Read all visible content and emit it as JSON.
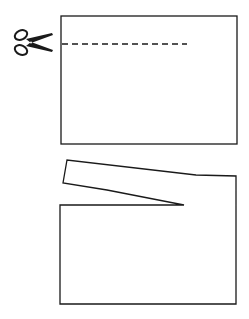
{
  "diagram": {
    "colors": {
      "stroke": "#1a1a1a",
      "background": "#ffffff"
    },
    "step1": {
      "sheet": {
        "x": 61,
        "y": 16,
        "width": 176,
        "height": 128
      },
      "cut_line": {
        "x1": 62,
        "y1": 44,
        "x2": 186,
        "y2": 44,
        "style": "dashed"
      },
      "icon": "scissors-icon"
    },
    "step2": {
      "sheet_outline": "60,205 184,205 107,190 63,183 67,160 196,175 236,176 236,304 60,304",
      "lifted_strip": "partially cut strip bending upward from the sheet"
    }
  }
}
